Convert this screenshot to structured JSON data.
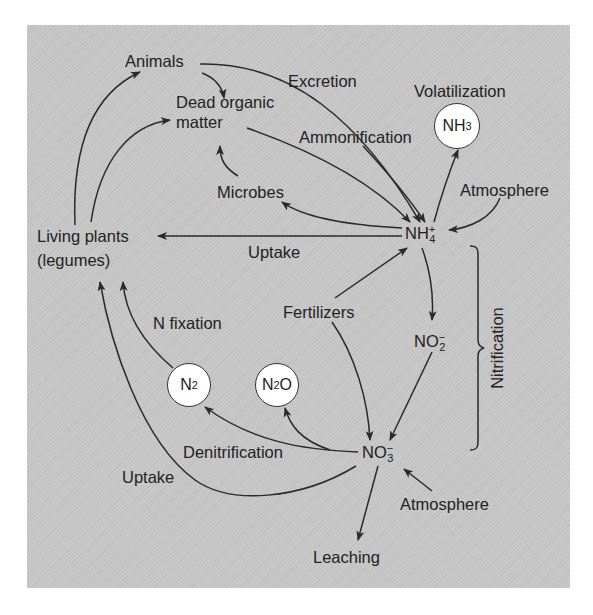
{
  "diagram": {
    "background_color": "#c7c7c7",
    "line_color": "#2a2a2a",
    "nodes": {
      "animals": "Animals",
      "dead_organic_matter_line1": "Dead organic",
      "dead_organic_matter_line2": "matter",
      "microbes": "Microbes",
      "living_plants_line1": "Living plants",
      "living_plants_line2": "(legumes)",
      "fertilizers": "Fertilizers",
      "leaching": "Leaching",
      "atmosphere_upper": "Atmosphere",
      "atmosphere_lower": "Atmosphere",
      "nh4": {
        "base": "NH",
        "sub": "4",
        "sup": "+"
      },
      "no2": {
        "base": "NO",
        "sub": "2",
        "sup": "−"
      },
      "no3": {
        "base": "NO",
        "sub": "3",
        "sup": "−"
      },
      "nh3": {
        "base": "NH",
        "sub": "3"
      },
      "n2": {
        "base": "N",
        "sub": "2"
      },
      "n2o": {
        "base": "N",
        "sub": "2",
        "tail": "O"
      }
    },
    "process_labels": {
      "excretion": "Excretion",
      "volatilization": "Volatilization",
      "ammonification": "Ammonification",
      "uptake_upper": "Uptake",
      "uptake_lower": "Uptake",
      "n_fixation": "N fixation",
      "denitrification": "Denitrification",
      "nitrification": "Nitrification"
    },
    "edges": [
      {
        "from": "Living plants",
        "to": "Animals"
      },
      {
        "from": "Living plants",
        "to": "Dead organic matter"
      },
      {
        "from": "Animals",
        "to": "Dead organic matter"
      },
      {
        "from": "Animals",
        "to": "NH4+",
        "label": "Excretion"
      },
      {
        "from": "Dead organic matter",
        "to": "NH4+",
        "label": "Ammonification"
      },
      {
        "from": "Microbes",
        "to": "Dead organic matter"
      },
      {
        "from": "NH4+",
        "to": "Microbes"
      },
      {
        "from": "NH4+",
        "to": "NH3",
        "label": "Volatilization"
      },
      {
        "from": "Atmosphere",
        "to": "NH4+"
      },
      {
        "from": "NH4+",
        "to": "Living plants",
        "label": "Uptake"
      },
      {
        "from": "Fertilizers",
        "to": "NH4+"
      },
      {
        "from": "Fertilizers",
        "to": "NO3-"
      },
      {
        "from": "NH4+",
        "to": "NO2-",
        "label": "Nitrification"
      },
      {
        "from": "NO2-",
        "to": "NO3-",
        "label": "Nitrification"
      },
      {
        "from": "NO3-",
        "to": "N2",
        "label": "Denitrification"
      },
      {
        "from": "NO3-",
        "to": "N2O",
        "label": "Denitrification"
      },
      {
        "from": "N2",
        "to": "Living plants",
        "label": "N fixation"
      },
      {
        "from": "NO3-",
        "to": "Living plants",
        "label": "Uptake"
      },
      {
        "from": "Atmosphere",
        "to": "NO3-"
      },
      {
        "from": "NO3-",
        "to": "Leaching"
      }
    ]
  }
}
